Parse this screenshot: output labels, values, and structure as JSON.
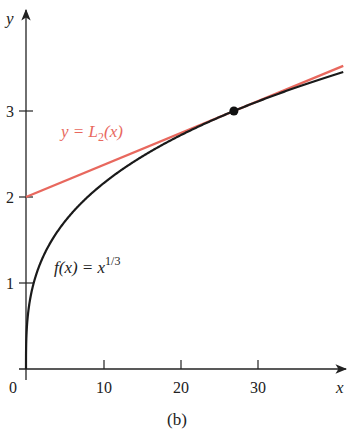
{
  "caption": "(b)",
  "colors": {
    "curve": "#1a1a1a",
    "tangent": "#e8685e",
    "axis": "#222222",
    "point": "#111111"
  },
  "labels": {
    "f_label_prefix": "f(x) = x",
    "f_label_exp": "1/3",
    "L_label_prefix": "y = L",
    "L_label_sub": "2",
    "L_label_suffix": "(x)"
  },
  "chart_data": {
    "type": "line",
    "title": "",
    "xlabel": "x",
    "ylabel": "y",
    "xlim": [
      0,
      40
    ],
    "ylim": [
      0,
      4
    ],
    "xticks": [
      10,
      20,
      30
    ],
    "yticks": [
      1,
      2,
      3
    ],
    "origin_label": "0",
    "grid": false,
    "series": [
      {
        "name": "f(x) = x^(1/3)",
        "kind": "function",
        "x": [
          0,
          1,
          2,
          5,
          8,
          10,
          15,
          20,
          27,
          30,
          35,
          40
        ],
        "values": [
          0,
          1,
          1.26,
          1.71,
          2,
          2.154,
          2.466,
          2.714,
          3,
          3.107,
          3.271,
          3.42
        ]
      },
      {
        "name": "y = L2(x)",
        "kind": "tangent line at x=27",
        "x": [
          0,
          27,
          40
        ],
        "values": [
          2,
          3,
          3.48
        ]
      }
    ],
    "annotations": [
      {
        "type": "point",
        "x": 27,
        "y": 3
      }
    ]
  }
}
